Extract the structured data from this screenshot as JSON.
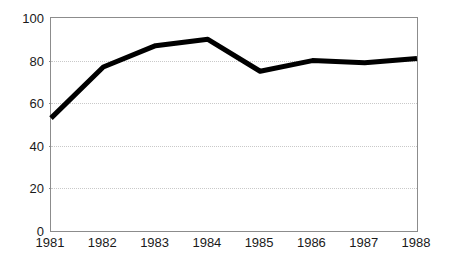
{
  "chart_data": {
    "type": "line",
    "title": "",
    "subtitle": "",
    "xlabel": "",
    "ylabel": "",
    "categories": [
      "1981",
      "1982",
      "1983",
      "1984",
      "1985",
      "1986",
      "1987",
      "1988"
    ],
    "x": [
      1981,
      1982,
      1983,
      1984,
      1985,
      1986,
      1987,
      1988
    ],
    "values": [
      53,
      77,
      87,
      90,
      75,
      80,
      79,
      81
    ],
    "series": [
      {
        "name": "",
        "values": [
          53,
          77,
          87,
          90,
          75,
          80,
          79,
          81
        ]
      }
    ],
    "ylim": [
      0,
      100
    ],
    "yticks": [
      0,
      20,
      40,
      60,
      80,
      100
    ],
    "ytick_labels": [
      "0",
      "20",
      "40",
      "60",
      "80",
      "100"
    ],
    "xtick_labels": [
      "1981",
      "1982",
      "1983",
      "1984",
      "1985",
      "1986",
      "1987",
      "1988"
    ],
    "grid": "horizontal-dotted",
    "legend": "none",
    "line_color": "#000000",
    "line_width": 5,
    "grid_color": "#c9c9c9",
    "frame_color": "#8c8c8c",
    "background_color": "#ffffff",
    "annotations": []
  }
}
